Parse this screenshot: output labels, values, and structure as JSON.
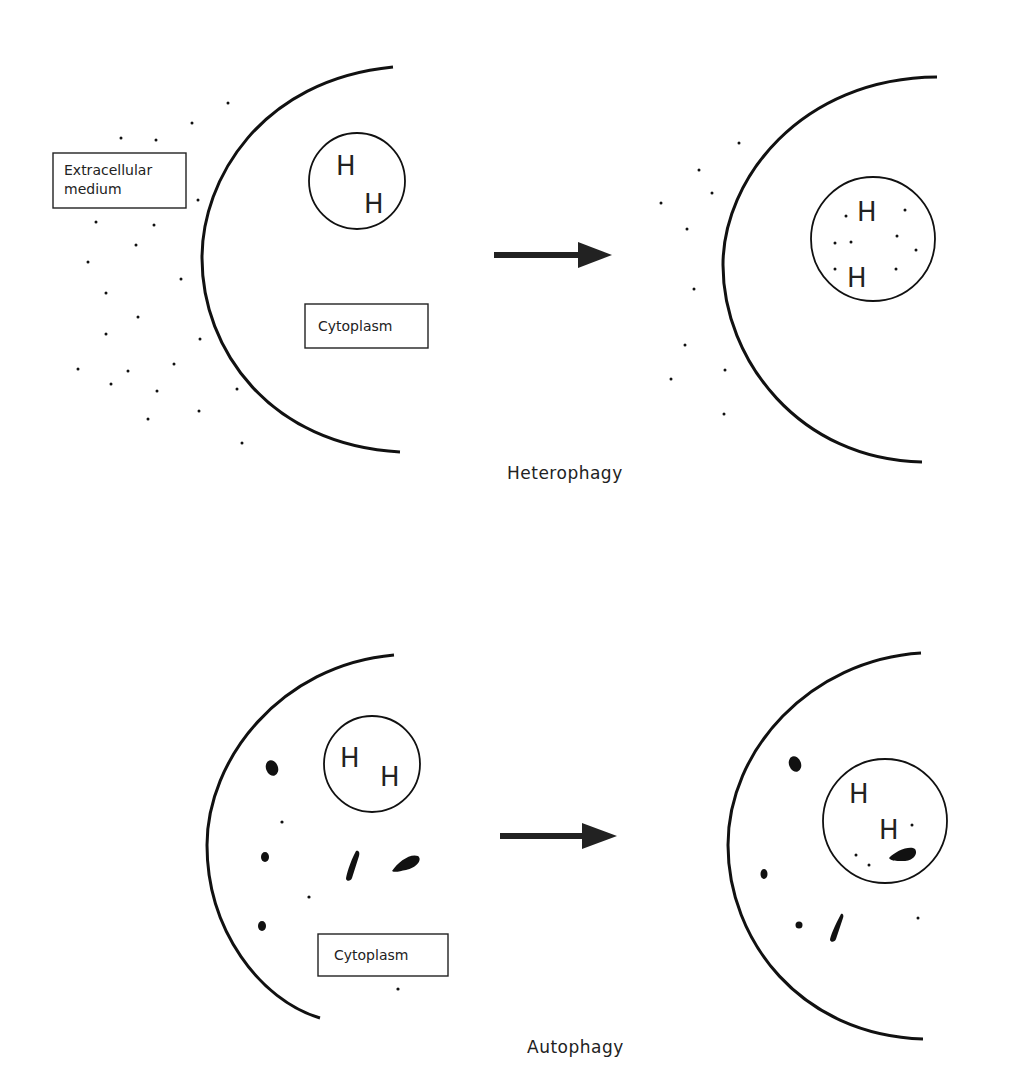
{
  "panels": {
    "heterophagy": {
      "caption": "Heterophagy",
      "before": {
        "box_extracellular_line1": "Extracellular",
        "box_extracellular_line2": "medium",
        "box_cytoplasm": "Cytoplasm",
        "lysosome_letters": [
          "H",
          "H"
        ]
      },
      "after": {
        "lysosome_letters": [
          "H",
          "H"
        ]
      }
    },
    "autophagy": {
      "caption": "Autophagy",
      "before": {
        "box_cytoplasm": "Cytoplasm",
        "lysosome_letters": [
          "H",
          "H"
        ]
      },
      "after": {
        "lysosome_letters": [
          "H",
          "H"
        ]
      }
    }
  },
  "arrow_icon": "right-arrow-icon"
}
